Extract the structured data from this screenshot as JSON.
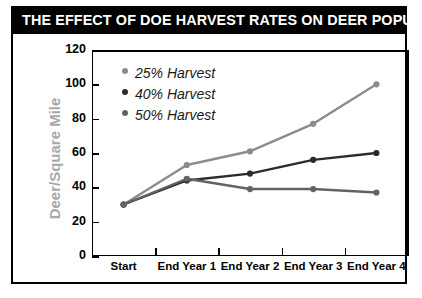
{
  "title": "THE EFFECT OF DOE HARVEST RATES ON DEER POPULATION",
  "legend": {
    "items": [
      {
        "label": "25% Harvest",
        "color": "#8c8c8c"
      },
      {
        "label": "40% Harvest",
        "color": "#2b2b2b"
      },
      {
        "label": "50% Harvest",
        "color": "#636363"
      }
    ]
  },
  "axis": {
    "y_title": "Deer/Square Mile",
    "y_ticks": [
      "0",
      "20",
      "40",
      "60",
      "80",
      "100",
      "120"
    ],
    "x_ticks": [
      "Start",
      "End Year 1",
      "End Year 2",
      "End Year 3",
      "End Year 4"
    ]
  },
  "colors": {
    "title_band": "#000000",
    "title_text": "#ffffff",
    "frame": "#000000",
    "y_title": "#a8a8a8",
    "background": "#ffffff"
  },
  "chart_data": {
    "type": "line",
    "title": "THE EFFECT OF DOE HARVEST RATES ON DEER POPULATION",
    "xlabel": "",
    "ylabel": "Deer/Square Mile",
    "categories": [
      "Start",
      "End Year 1",
      "End Year 2",
      "End Year 3",
      "End Year 4"
    ],
    "ylim": [
      0,
      120
    ],
    "yticks": [
      0,
      20,
      40,
      60,
      80,
      100,
      120
    ],
    "grid": false,
    "legend_position": "upper-left-inside",
    "series": [
      {
        "name": "25% Harvest",
        "color": "#8c8c8c",
        "values": [
          30,
          53,
          61,
          77,
          100
        ]
      },
      {
        "name": "40% Harvest",
        "color": "#2b2b2b",
        "values": [
          30,
          44,
          48,
          56,
          60
        ]
      },
      {
        "name": "50% Harvest",
        "color": "#636363",
        "values": [
          30,
          45,
          39,
          39,
          37
        ]
      }
    ]
  }
}
